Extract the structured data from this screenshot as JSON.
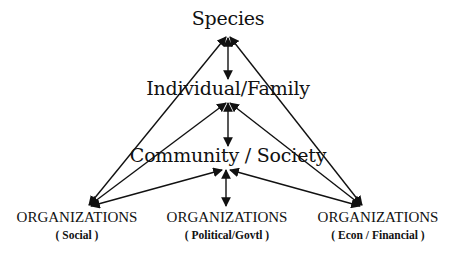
{
  "diagram": {
    "type": "hierarchy-triangle",
    "nodes": {
      "species": {
        "label": "Species"
      },
      "individual": {
        "label": "Individual/Family"
      },
      "community": {
        "label": "Community / Society"
      },
      "org_social": {
        "title": "ORGANIZATIONS",
        "subtitle": "( Social )"
      },
      "org_political": {
        "title": "ORGANIZATIONS",
        "subtitle": "( Political/Govtl )"
      },
      "org_econ": {
        "title": "ORGANIZATIONS",
        "subtitle": "( Econ / Financial )"
      }
    },
    "edges": [
      {
        "from": "species",
        "to": "individual",
        "arrow": "both"
      },
      {
        "from": "individual",
        "to": "community",
        "arrow": "both"
      },
      {
        "from": "community",
        "to": "org_political",
        "arrow": "both"
      },
      {
        "from": "species",
        "to": "org_social",
        "arrow": "both"
      },
      {
        "from": "species",
        "to": "org_econ",
        "arrow": "both"
      },
      {
        "from": "individual",
        "to": "org_social",
        "arrow": "both"
      },
      {
        "from": "individual",
        "to": "org_econ",
        "arrow": "both"
      },
      {
        "from": "community",
        "to": "org_social",
        "arrow": "both"
      },
      {
        "from": "community",
        "to": "org_econ",
        "arrow": "both"
      }
    ],
    "colors": {
      "line": "#111111",
      "text": "#111111",
      "background": "#ffffff"
    }
  }
}
